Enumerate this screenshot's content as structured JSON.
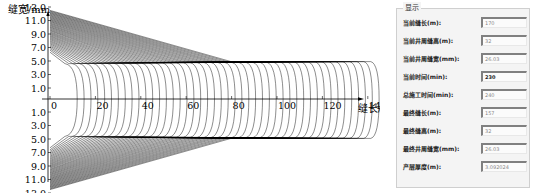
{
  "chart_data": {
    "type": "line",
    "title": "",
    "xlabel": "缝长/m",
    "ylabel": "缝宽/mm",
    "x_ticks": [
      "0",
      "20",
      "40",
      "60",
      "80",
      "100",
      "120",
      "140"
    ],
    "y_ticks_upper": [
      "13.0",
      "11.0",
      "9.0",
      "7.0",
      "5.0",
      "3.0",
      "1.0"
    ],
    "y_ticks_lower": [
      "1.0",
      "3.0",
      "5.0",
      "7.0",
      "9.0",
      "11.0",
      "13.0"
    ],
    "xlim": [
      0,
      150
    ],
    "ylim": [
      -13.5,
      13.5
    ],
    "series_count_estimate": 45,
    "width_at_wellbore_range_mm": [
      6.3,
      12.5
    ],
    "max_length_m": 145,
    "grid": false,
    "legend": "none"
  },
  "panel": {
    "title": "显示",
    "rows": [
      {
        "label": "当前缝长(m):",
        "value": "170",
        "dark": false
      },
      {
        "label": "当前井周缝高(m):",
        "value": "32",
        "dark": false
      },
      {
        "label": "当前井周缝宽(mm):",
        "value": "26.03",
        "dark": false
      },
      {
        "label": "当前时间(min):",
        "value": "230",
        "dark": true
      },
      {
        "label": "总施工时间(min):",
        "value": "240",
        "dark": false
      },
      {
        "label": "最终缝长(m):",
        "value": "157",
        "dark": false
      },
      {
        "label": "最终缝高(m):",
        "value": "32",
        "dark": false
      },
      {
        "label": "最终井周缝宽(mm):",
        "value": "26.03",
        "dark": false
      },
      {
        "label": "产层厚度(m):",
        "value": "3.092024",
        "dark": false
      }
    ]
  }
}
